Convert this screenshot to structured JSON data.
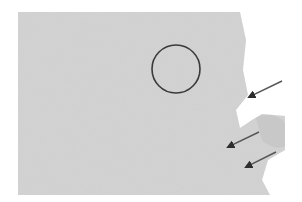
{
  "figure": {
    "kind": "grayscale micrograph",
    "background": "#ffffff",
    "texture_color": "#cfcfcf",
    "texture_dark": "#a9a9a9",
    "annotation_color": "#3a3a3a",
    "circle": {
      "cx": 176,
      "cy": 69,
      "r": 24
    },
    "arrows": [
      {
        "x1": 282,
        "y1": 81,
        "x2": 247,
        "y2": 98
      },
      {
        "x1": 259,
        "y1": 132,
        "x2": 226,
        "y2": 148
      },
      {
        "x1": 276,
        "y1": 152,
        "x2": 244,
        "y2": 168
      }
    ]
  }
}
